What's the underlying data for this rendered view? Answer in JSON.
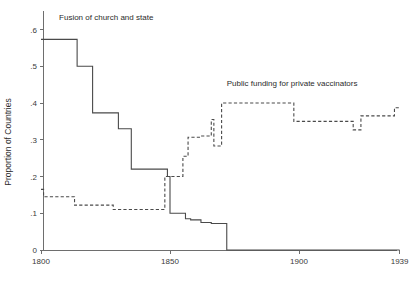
{
  "chart_data": {
    "type": "line",
    "title": "",
    "subtitle": "",
    "xlabel": "",
    "ylabel": "Proportion of Countries",
    "xlim": [
      1800,
      1939
    ],
    "ylim": [
      0,
      0.65
    ],
    "grid": false,
    "legend_position": "inline-annotations",
    "xticks": [
      1800,
      1850,
      1900,
      1939
    ],
    "xtick_labels": [
      "1800",
      "1850",
      "1900",
      "1939"
    ],
    "yticks": [
      0,
      0.1,
      0.2,
      0.3,
      0.4,
      0.5,
      0.6
    ],
    "ytick_labels": [
      "0",
      ".1",
      ".2",
      ".3",
      ".4",
      ".5",
      ".6"
    ],
    "series": [
      {
        "name": "Fusion of church and state",
        "style": "solid",
        "color": "#4a4a4a",
        "annotation": "Fusion of church and state",
        "annotation_x": 1807,
        "annotation_y": 0.625,
        "step": "post",
        "x": [
          1800,
          1814,
          1814,
          1820,
          1820,
          1830,
          1830,
          1835,
          1835,
          1847,
          1847,
          1849,
          1849,
          1850,
          1850,
          1856,
          1856,
          1858,
          1858,
          1862,
          1862,
          1866,
          1866,
          1872,
          1872,
          1939
        ],
        "y": [
          0.573,
          0.573,
          0.5,
          0.5,
          0.373,
          0.373,
          0.33,
          0.33,
          0.22,
          0.22,
          0.22,
          0.22,
          0.2,
          0.2,
          0.1,
          0.1,
          0.085,
          0.085,
          0.082,
          0.082,
          0.075,
          0.075,
          0.072,
          0.072,
          0.0,
          0.0
        ],
        "points": [
          {
            "year": 1800,
            "value": 0.573
          },
          {
            "year": 1814,
            "value": 0.5
          },
          {
            "year": 1820,
            "value": 0.373
          },
          {
            "year": 1830,
            "value": 0.33
          },
          {
            "year": 1835,
            "value": 0.22
          },
          {
            "year": 1849,
            "value": 0.2
          },
          {
            "year": 1850,
            "value": 0.1
          },
          {
            "year": 1856,
            "value": 0.085
          },
          {
            "year": 1858,
            "value": 0.082
          },
          {
            "year": 1862,
            "value": 0.075
          },
          {
            "year": 1866,
            "value": 0.072
          },
          {
            "year": 1872,
            "value": 0.0
          },
          {
            "year": 1939,
            "value": 0.0
          }
        ]
      },
      {
        "name": "Public funding for private vaccinators",
        "style": "dashed",
        "color": "#4a4a4a",
        "annotation": "Public funding for private vaccinators",
        "annotation_x": 1872,
        "annotation_y": 0.445,
        "step": "post",
        "x": [
          1800,
          1801,
          1801,
          1813,
          1813,
          1828,
          1828,
          1847,
          1847,
          1848,
          1848,
          1855,
          1855,
          1857,
          1857,
          1859,
          1859,
          1862,
          1862,
          1866,
          1866,
          1867,
          1867,
          1869,
          1869,
          1870,
          1870,
          1872,
          1872,
          1898,
          1898,
          1900,
          1900,
          1921,
          1921,
          1924,
          1924,
          1937,
          1937,
          1939
        ],
        "y": [
          0.165,
          0.165,
          0.145,
          0.145,
          0.122,
          0.122,
          0.11,
          0.11,
          0.11,
          0.11,
          0.2,
          0.2,
          0.255,
          0.255,
          0.307,
          0.307,
          0.307,
          0.307,
          0.31,
          0.31,
          0.355,
          0.355,
          0.283,
          0.283,
          0.283,
          0.283,
          0.4,
          0.4,
          0.4,
          0.4,
          0.35,
          0.35,
          0.35,
          0.35,
          0.327,
          0.327,
          0.365,
          0.365,
          0.387,
          0.387
        ],
        "points": [
          {
            "year": 1800,
            "value": 0.165
          },
          {
            "year": 1801,
            "value": 0.145
          },
          {
            "year": 1813,
            "value": 0.122
          },
          {
            "year": 1828,
            "value": 0.11
          },
          {
            "year": 1848,
            "value": 0.2
          },
          {
            "year": 1855,
            "value": 0.255
          },
          {
            "year": 1857,
            "value": 0.307
          },
          {
            "year": 1862,
            "value": 0.31
          },
          {
            "year": 1866,
            "value": 0.355
          },
          {
            "year": 1867,
            "value": 0.283
          },
          {
            "year": 1870,
            "value": 0.4
          },
          {
            "year": 1898,
            "value": 0.4
          },
          {
            "year": 1900,
            "value": 0.35
          },
          {
            "year": 1921,
            "value": 0.327
          },
          {
            "year": 1924,
            "value": 0.365
          },
          {
            "year": 1937,
            "value": 0.387
          },
          {
            "year": 1939,
            "value": 0.387
          }
        ]
      }
    ]
  },
  "axes": {
    "y_title": "Proportion of Countries"
  },
  "colors": {
    "line": "#4a4a4a",
    "axis": "#6e6e6e",
    "text": "#2b2b2b",
    "background": "#ffffff"
  }
}
